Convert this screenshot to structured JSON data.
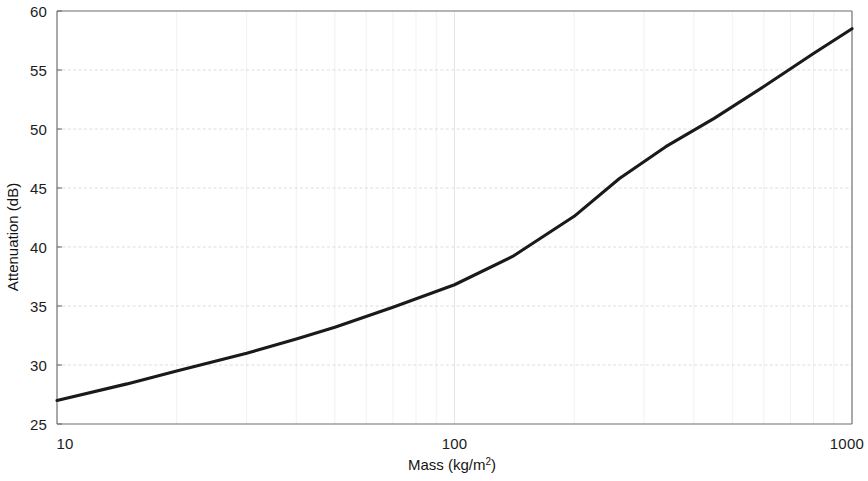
{
  "chart_data": {
    "type": "line",
    "title": "",
    "xlabel": "Mass (kg/m²)",
    "ylabel": "Attenuation (dB)",
    "xscale": "log",
    "yscale": "linear",
    "xlim": [
      10,
      1000
    ],
    "ylim": [
      25,
      60
    ],
    "grid": true,
    "legend": null,
    "x_ticks": [
      10,
      100,
      1000
    ],
    "x_tick_labels": [
      "10",
      "100",
      "1000"
    ],
    "y_ticks": [
      25,
      30,
      35,
      40,
      45,
      50,
      55,
      60
    ],
    "y_tick_labels": [
      "25",
      "30",
      "35",
      "40",
      "45",
      "50",
      "55",
      "60"
    ],
    "series": [
      {
        "name": "Attenuation",
        "color": "#1a1a1a",
        "x": [
          10,
          15,
          20,
          30,
          40,
          50,
          70,
          100,
          140,
          200,
          260,
          340,
          450,
          600,
          800,
          1000
        ],
        "values": [
          27.0,
          28.4,
          29.5,
          31.0,
          32.2,
          33.2,
          34.9,
          36.8,
          39.2,
          42.6,
          45.8,
          48.5,
          50.9,
          53.6,
          56.4,
          58.5
        ]
      }
    ],
    "annotations": [
      {
        "label": "slope change",
        "x": 200,
        "y": 42.6
      }
    ]
  },
  "axes": {
    "x_title": "Mass (kg/m",
    "x_title_sup": "2",
    "x_title_close": ")",
    "y_title": "Attenuation (dB)"
  },
  "ticks": {
    "y": [
      {
        "value": 60,
        "label": "60"
      },
      {
        "value": 55,
        "label": "55"
      },
      {
        "value": 50,
        "label": "50"
      },
      {
        "value": 45,
        "label": "45"
      },
      {
        "value": 40,
        "label": "40"
      },
      {
        "value": 35,
        "label": "35"
      },
      {
        "value": 30,
        "label": "30"
      },
      {
        "value": 25,
        "label": "25"
      }
    ],
    "x": [
      {
        "value": 10,
        "label": "10"
      },
      {
        "value": 100,
        "label": "100"
      },
      {
        "value": 1000,
        "label": "1000"
      }
    ]
  },
  "colors": {
    "curve": "#1a1a1a",
    "axis": "#6d6d6d",
    "grid_major": "#d9d9d9",
    "grid_minor": "#ededed",
    "text": "#1a1a1a",
    "background": "#ffffff"
  }
}
